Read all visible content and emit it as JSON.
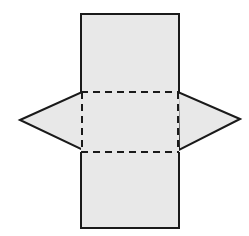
{
  "diagram": {
    "colors": {
      "fill": "#e8e8e8",
      "stroke": "#1a1a1a",
      "background": "#ffffff"
    },
    "shapes": {
      "rectangle": {
        "x1": 81,
        "y1": 14,
        "x2": 179,
        "y2": 228
      },
      "fold_lines": {
        "y_top": 92,
        "y_bottom": 152,
        "x_left": 82,
        "x_right": 178
      },
      "left_triangle": {
        "tip": [
          20,
          120
        ],
        "base_top": [
          82,
          92
        ],
        "base_bottom": [
          83,
          150
        ]
      },
      "right_triangle": {
        "tip": [
          240,
          119
        ],
        "base_top": [
          178,
          92
        ],
        "base_bottom": [
          179,
          150
        ]
      }
    }
  }
}
